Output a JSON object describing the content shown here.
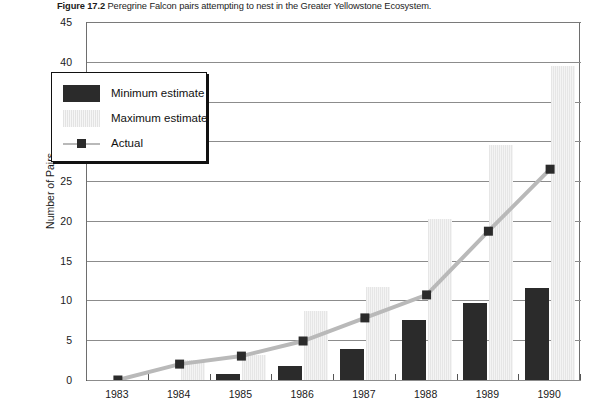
{
  "caption": {
    "figure_number": "Figure 17.2",
    "text": "Peregrine Falcon pairs attempting to nest in the Greater Yellowstone Ecosystem."
  },
  "legend": {
    "items": [
      {
        "label": "Minimum estimate",
        "icon": "dark-bar-swatch",
        "color": "#2b2b2b"
      },
      {
        "label": "Maximum estimate",
        "icon": "light-bar-swatch",
        "color": "#ececec"
      },
      {
        "label": "Actual",
        "icon": "line-marker-swatch",
        "color": "#b9b9b9"
      }
    ]
  },
  "chart_data": {
    "type": "bar",
    "title": "Peregrine Falcon pairs attempting to nest in the Greater Yellowstone Ecosystem.",
    "xlabel": "",
    "ylabel": "Number of Pairs",
    "ylim": [
      0,
      45
    ],
    "ytick_step": 5,
    "yticks": [
      "0",
      "5",
      "10",
      "15",
      "20",
      "25",
      "30",
      "35",
      "40",
      "45"
    ],
    "grid": true,
    "legend_position": "upper-left-inset",
    "categories": [
      "1983",
      "1984",
      "1985",
      "1986",
      "1987",
      "1988",
      "1989",
      "1990"
    ],
    "series": [
      {
        "name": "Minimum estimate",
        "kind": "bar",
        "color": "#2b2b2b",
        "values": [
          0,
          0,
          0.7,
          1.8,
          3.9,
          7.6,
          9.7,
          11.6
        ]
      },
      {
        "name": "Maximum estimate",
        "kind": "bar",
        "color": "#ececec",
        "values": [
          0,
          2.5,
          3.2,
          8.7,
          11.7,
          20.2,
          29.5,
          39.5
        ]
      },
      {
        "name": "Actual",
        "kind": "line",
        "color": "#b9b9b9",
        "marker": "square",
        "marker_color": "#2b2b2b",
        "values": [
          0,
          2.0,
          3.0,
          4.9,
          7.8,
          10.7,
          18.7,
          26.5
        ]
      }
    ]
  }
}
